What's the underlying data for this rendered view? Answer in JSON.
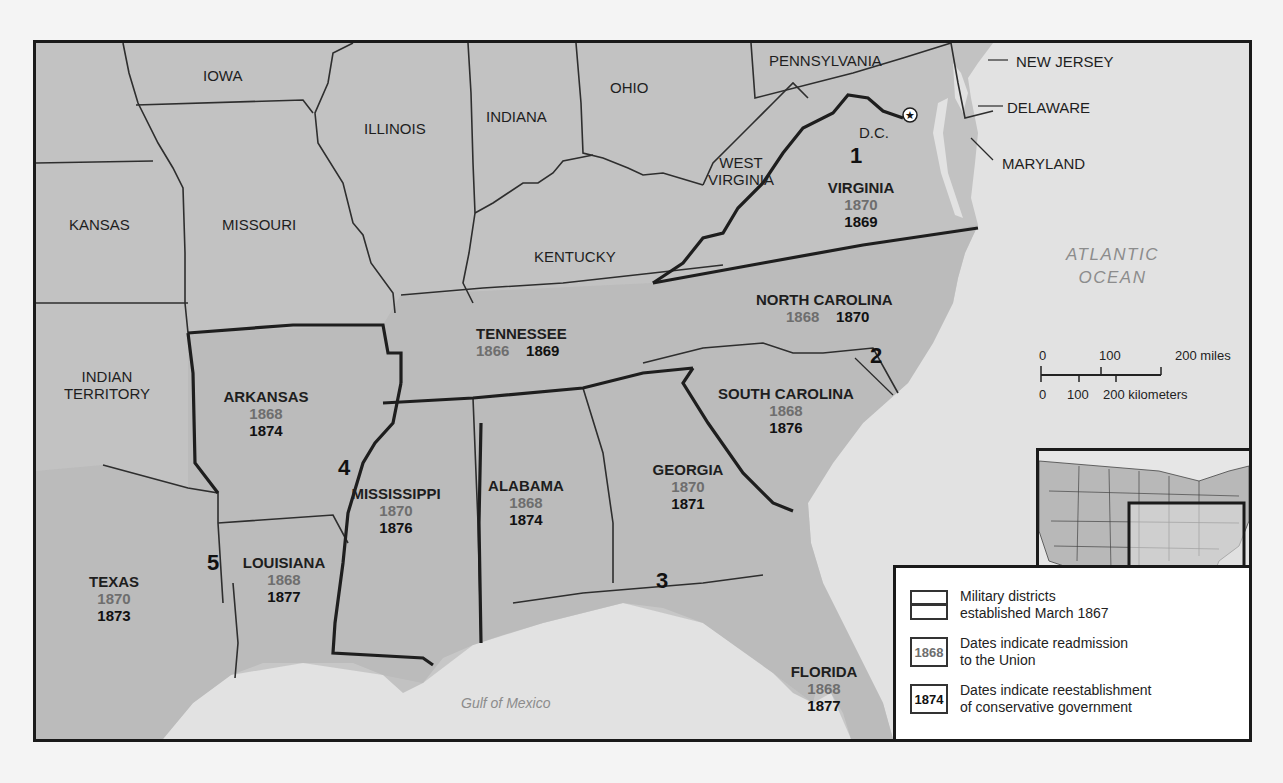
{
  "map": {
    "title_visible": false,
    "districts": [
      {
        "number": "1",
        "label": "1"
      },
      {
        "number": "2",
        "label": "2"
      },
      {
        "number": "3",
        "label": "3"
      },
      {
        "number": "4",
        "label": "4"
      },
      {
        "number": "5",
        "label": "5"
      }
    ],
    "confederate_states": [
      {
        "name": "VIRGINIA",
        "readmission": "1870",
        "conservative": "1869",
        "district": "1"
      },
      {
        "name": "NORTH CAROLINA",
        "readmission": "1868",
        "conservative": "1870",
        "district": "2"
      },
      {
        "name": "SOUTH CAROLINA",
        "readmission": "1868",
        "conservative": "1876",
        "district": "2"
      },
      {
        "name": "GEORGIA",
        "readmission": "1870",
        "conservative": "1871",
        "district": "3"
      },
      {
        "name": "ALABAMA",
        "readmission": "1868",
        "conservative": "1874",
        "district": "3"
      },
      {
        "name": "FLORIDA",
        "readmission": "1868",
        "conservative": "1877",
        "district": "3"
      },
      {
        "name": "MISSISSIPPI",
        "readmission": "1870",
        "conservative": "1876",
        "district": "4"
      },
      {
        "name": "ARKANSAS",
        "readmission": "1868",
        "conservative": "1874",
        "district": "4"
      },
      {
        "name": "LOUISIANA",
        "readmission": "1868",
        "conservative": "1877",
        "district": "5"
      },
      {
        "name": "TEXAS",
        "readmission": "1870",
        "conservative": "1873",
        "district": "5"
      },
      {
        "name": "TENNESSEE",
        "readmission": "1866",
        "conservative": "1869",
        "district": ""
      }
    ],
    "other_states": {
      "iowa": "IOWA",
      "illinois": "ILLINOIS",
      "indiana": "INDIANA",
      "ohio": "OHIO",
      "pennsylvania": "PENNSYLVANIA",
      "new_jersey": "NEW JERSEY",
      "delaware": "DELAWARE",
      "maryland": "MARYLAND",
      "west_virginia_1": "WEST",
      "west_virginia_2": "VIRGINIA",
      "kansas": "KANSAS",
      "missouri": "MISSOURI",
      "kentucky": "KENTUCKY",
      "indian_territory_1": "INDIAN",
      "indian_territory_2": "TERRITORY",
      "dc": "D.C."
    },
    "water": {
      "atlantic_1": "ATLANTIC",
      "atlantic_2": "OCEAN",
      "gulf": "Gulf of Mexico"
    },
    "scale": {
      "miles": [
        "0",
        "100",
        "200 miles"
      ],
      "km": [
        "0",
        "100",
        "200 kilometers"
      ]
    },
    "legend": {
      "items": [
        {
          "swatch": "",
          "line1": "Military districts",
          "line2": "established March 1867"
        },
        {
          "swatch": "1868",
          "line1": "Dates indicate readmission",
          "line2": "to the Union"
        },
        {
          "swatch": "1874",
          "line1": "Dates indicate reestablishment",
          "line2": "of conservative government"
        }
      ]
    },
    "colors": {
      "land": "#c4c4c4",
      "southern_land": "#b4b4b4",
      "water": "#e2e2e2",
      "border": "#2a2a2a",
      "readmission_text": "#6e6e6e",
      "conservative_text": "#111111"
    }
  }
}
